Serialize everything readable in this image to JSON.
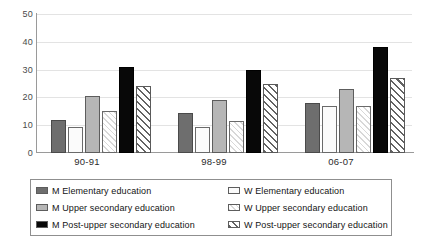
{
  "chart_data": {
    "type": "bar",
    "title": "",
    "xlabel": "",
    "ylabel": "",
    "ylim": [
      0,
      50
    ],
    "yticks": [
      0,
      10,
      20,
      30,
      40,
      50
    ],
    "grid": true,
    "legend_position": "bottom",
    "categories": [
      "90-91",
      "98-99",
      "06-07"
    ],
    "series": [
      {
        "name": "M Elementary education",
        "key": "m-elementary",
        "values": [
          12,
          14.5,
          18
        ],
        "fill": "#6e6e6e",
        "pattern": "solid"
      },
      {
        "name": "W Elementary education",
        "key": "w-elementary",
        "values": [
          9.5,
          9.5,
          17
        ],
        "fill": "#fbfbfb",
        "pattern": "solid"
      },
      {
        "name": "M Upper secondary education",
        "key": "m-upper",
        "values": [
          20.5,
          19,
          23
        ],
        "fill": "#b6b6b6",
        "pattern": "solid"
      },
      {
        "name": "W Upper secondary education",
        "key": "w-upper",
        "values": [
          15,
          11.5,
          17
        ],
        "fill": "#ffffff",
        "pattern": "light-diagonal"
      },
      {
        "name": "M Post-upper secondary education",
        "key": "m-post-upper",
        "values": [
          31,
          30,
          38
        ],
        "fill": "#080808",
        "pattern": "solid"
      },
      {
        "name": "W Post-upper secondary education",
        "key": "w-post-upper",
        "values": [
          24,
          25,
          27
        ],
        "fill": "#ffffff",
        "pattern": "bold-diagonal"
      }
    ]
  },
  "axis": {
    "ytick_0": "0",
    "ytick_1": "10",
    "ytick_2": "20",
    "ytick_3": "30",
    "ytick_4": "40",
    "ytick_5": "50",
    "xtick_0": "90-91",
    "xtick_1": "98-99",
    "xtick_2": "06-07"
  },
  "legend": {
    "col_left": [
      "M Elementary education",
      "M Upper secondary education",
      "M Post-upper secondary education"
    ],
    "col_right": [
      "W Elementary education",
      "W Upper secondary education",
      "W Post-upper secondary education"
    ]
  },
  "colors": {
    "dark_gray": "#6e6e6e",
    "light_gray": "#b6b6b6",
    "black": "#080808",
    "white": "#ffffff",
    "gridline": "#e3e3e3",
    "axis": "#9a9a9a",
    "legend_border": "#8f8f8f"
  }
}
